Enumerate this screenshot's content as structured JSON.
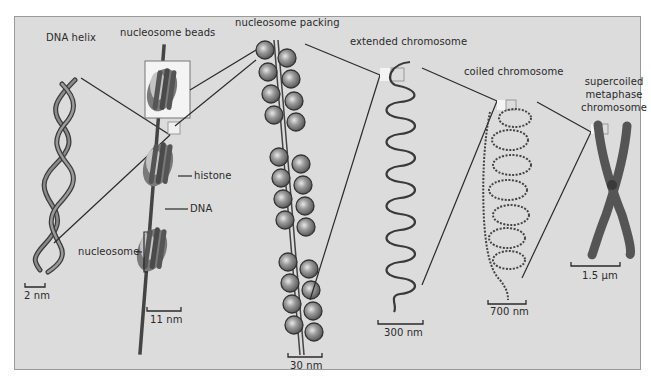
{
  "diagram": {
    "colors": {
      "panel_background": "#dcdcdc",
      "panel_border": "#9a9a9a",
      "line": "#2a2a2a",
      "dna_strand": "#555555",
      "histone_dark": "#6a6a6a",
      "histone_light": "#b8b8b8"
    },
    "stages": [
      {
        "id": "dna-helix",
        "label": "DNA helix",
        "scale": "2 nm"
      },
      {
        "id": "nucleosome-beads",
        "label": "nucleosome beads",
        "scale": "11 nm"
      },
      {
        "id": "nucleosome-packing",
        "label": "nucleosome packing",
        "scale": "30 nm"
      },
      {
        "id": "extended-chromosome",
        "label": "extended chromosome",
        "scale": "300 nm"
      },
      {
        "id": "coiled-chromosome",
        "label": "coiled chromosome",
        "scale": "700 nm"
      },
      {
        "id": "supercoiled-chromosome",
        "label_lines": [
          "supercoiled",
          "metaphase",
          "chromosome"
        ],
        "scale": "1.5 µm"
      }
    ],
    "callouts": {
      "histone": "histone",
      "dna": "DNA",
      "nucleosome": "nucleosome"
    }
  }
}
